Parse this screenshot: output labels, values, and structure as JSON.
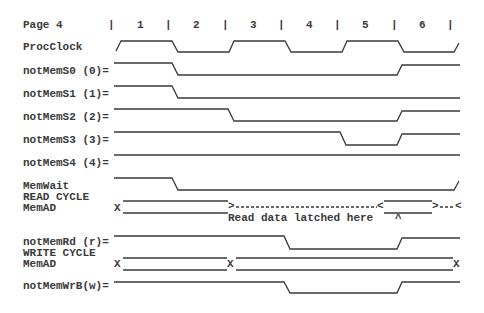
{
  "header": {
    "title": "Page 4",
    "separator": "|",
    "cycles": [
      "1",
      "2",
      "3",
      "4",
      "5",
      "6"
    ]
  },
  "signals": [
    {
      "id": "procclock",
      "label": "ProcClock"
    },
    {
      "id": "notmems0",
      "label": "notMemS0 (0)="
    },
    {
      "id": "notmems1",
      "label": "notMemS1 (1)="
    },
    {
      "id": "notmems2",
      "label": "notMemS2 (2)="
    },
    {
      "id": "notmems3",
      "label": "notMemS3 (3)="
    },
    {
      "id": "notmems4",
      "label": "notMemS4 (4)="
    },
    {
      "id": "memwait",
      "label": "MemWait"
    },
    {
      "id": "read_cycle",
      "label": "READ CYCLE"
    },
    {
      "id": "memad_read",
      "label": "MemAD"
    },
    {
      "id": "notmemrd",
      "label": "notMemRd (r)="
    },
    {
      "id": "write_cycle",
      "label": "WRITE CYCLE"
    },
    {
      "id": "memad_write",
      "label": "MemAD"
    },
    {
      "id": "notmemwrb",
      "label": "notMemWrB(w)="
    }
  ],
  "annotations": {
    "read_latch": "Read data latched here",
    "caret": "^",
    "x_marker": "X",
    "bus_open": ">",
    "bus_close": "<"
  },
  "colors": {
    "ink": "#3a3a3a",
    "background": "#ffffff"
  }
}
